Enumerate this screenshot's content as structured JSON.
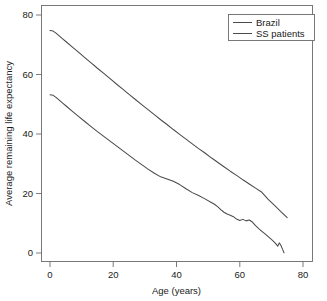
{
  "chart_data": {
    "type": "line",
    "title": "",
    "xlabel": "Age (years)",
    "ylabel": "Average remaining life expectancy",
    "xlim": [
      -3,
      83
    ],
    "ylim": [
      -3,
      83
    ],
    "xticks": [
      0,
      20,
      40,
      60,
      80
    ],
    "yticks": [
      0,
      20,
      40,
      60,
      80
    ],
    "xtick_labels": [
      "0",
      "20",
      "40",
      "60",
      "80"
    ],
    "ytick_labels": [
      "0",
      "20",
      "40",
      "60",
      "80"
    ],
    "grid": false,
    "legend_position": "top-right",
    "series": [
      {
        "name": "Brazil",
        "color": "#4a4a4a",
        "x": [
          0,
          1,
          2,
          3,
          4,
          5,
          7,
          9,
          11,
          13,
          15,
          17,
          19,
          21,
          23,
          25,
          27,
          29,
          31,
          33,
          35,
          37,
          39,
          41,
          43,
          45,
          47,
          49,
          51,
          53,
          55,
          57,
          59,
          61,
          63,
          65,
          67,
          69,
          71,
          73,
          75
        ],
        "y": [
          74.8,
          74.6,
          73.8,
          72.9,
          72.0,
          71.1,
          69.3,
          67.5,
          65.7,
          63.9,
          62.1,
          60.4,
          58.6,
          56.8,
          55.1,
          53.3,
          51.6,
          49.9,
          48.2,
          46.5,
          44.8,
          43.2,
          41.5,
          39.9,
          38.3,
          36.7,
          35.1,
          33.6,
          32.0,
          30.5,
          29.0,
          27.5,
          26.1,
          24.6,
          23.2,
          21.8,
          20.4,
          18.0,
          16.0,
          13.9,
          11.9
        ]
      },
      {
        "name": "SS patients",
        "color": "#4a4a4a",
        "x": [
          0,
          1,
          2,
          3,
          4,
          5,
          7,
          9,
          11,
          13,
          15,
          17,
          19,
          21,
          23,
          25,
          27,
          29,
          31,
          33,
          35,
          37,
          39,
          41,
          43,
          45,
          47,
          49,
          51,
          52,
          53,
          54,
          55,
          56,
          57,
          58,
          59,
          60,
          61,
          62,
          63,
          64,
          65,
          66,
          67,
          68,
          69,
          70,
          71,
          71.5,
          72,
          72.5,
          73,
          73.5,
          74
        ],
        "y": [
          53.2,
          53.0,
          52.2,
          51.3,
          50.4,
          49.5,
          47.7,
          45.9,
          44.2,
          42.5,
          40.8,
          39.2,
          37.6,
          36.0,
          34.4,
          32.8,
          31.2,
          29.7,
          28.2,
          26.8,
          25.6,
          24.9,
          24.1,
          23.0,
          21.6,
          20.3,
          19.3,
          18.2,
          17.0,
          16.4,
          15.6,
          14.6,
          13.7,
          13.1,
          12.7,
          12.2,
          11.4,
          10.9,
          11.3,
          10.8,
          11.1,
          10.4,
          9.2,
          8.2,
          7.3,
          6.4,
          5.5,
          4.6,
          3.6,
          3.0,
          2.3,
          3.4,
          2.6,
          1.3,
          0.1
        ]
      }
    ]
  },
  "legend": {
    "entries": [
      {
        "label": "Brazil"
      },
      {
        "label": "SS patients"
      }
    ]
  },
  "axes": {
    "x_title": "Age (years)",
    "y_title": "Average remaining life expectancy"
  }
}
